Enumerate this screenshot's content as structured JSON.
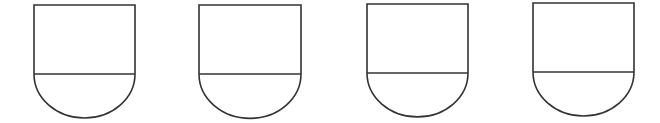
{
  "diagram": {
    "stroke_color": "#333333",
    "fill_color": "#ffffff",
    "stroke_width": 1.6,
    "shapes": [
      {
        "id": "shape-1",
        "left": 34,
        "right": 135,
        "top": 5,
        "divider": 74
      },
      {
        "id": "shape-2",
        "left": 199,
        "right": 301,
        "top": 5,
        "divider": 74
      },
      {
        "id": "shape-3",
        "left": 367,
        "right": 468,
        "top": 4,
        "divider": 73
      },
      {
        "id": "shape-4",
        "left": 533,
        "right": 634,
        "top": 3,
        "divider": 72
      }
    ]
  }
}
